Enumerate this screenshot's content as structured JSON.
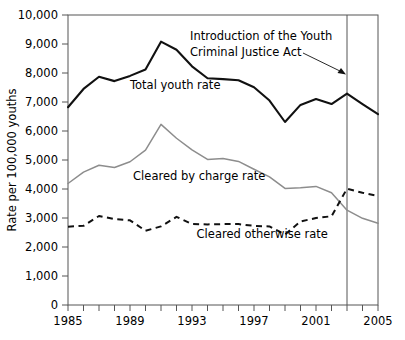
{
  "chart_data": {
    "type": "line",
    "title": "",
    "xlabel": "",
    "ylabel": "Rate per 100,000 youths",
    "xlim": [
      1985,
      2005
    ],
    "ylim": [
      0,
      10000
    ],
    "grid": false,
    "legend_position": "inline-labels",
    "x": [
      1985,
      1986,
      1987,
      1988,
      1989,
      1990,
      1991,
      1992,
      1993,
      1994,
      1995,
      1996,
      1997,
      1998,
      1999,
      2000,
      2001,
      2002,
      2003,
      2004,
      2005
    ],
    "y_ticks": [
      0,
      1000,
      2000,
      3000,
      4000,
      5000,
      6000,
      7000,
      8000,
      9000,
      10000
    ],
    "y_tick_labels": [
      "0",
      "1,000",
      "2,000",
      "3,000",
      "4,000",
      "5,000",
      "6,000",
      "7,000",
      "8,000",
      "9,000",
      "10,000"
    ],
    "x_ticks": [
      1985,
      1986,
      1987,
      1988,
      1989,
      1990,
      1991,
      1992,
      1993,
      1994,
      1995,
      1996,
      1997,
      1998,
      1999,
      2000,
      2001,
      2002,
      2003,
      2004,
      2005
    ],
    "x_tick_labels_shown": [
      "1985",
      "1989",
      "1993",
      "1997",
      "2001",
      "2005"
    ],
    "x_tick_label_values": [
      1985,
      1989,
      1993,
      1997,
      2001,
      2005
    ],
    "series": [
      {
        "name": "Total youth rate",
        "style": "solid-black",
        "color": "#111111",
        "label_x": 1989.0,
        "label_y": 7450,
        "values": [
          6820,
          7450,
          7870,
          7720,
          7900,
          8120,
          9080,
          8800,
          8230,
          7820,
          7790,
          7750,
          7510,
          7050,
          6310,
          6900,
          7100,
          6930,
          7290,
          6930,
          6580
        ]
      },
      {
        "name": "Cleared by charge rate",
        "style": "solid-gray",
        "color": "#8d8d8d",
        "label_x": 1989.2,
        "label_y": 4300,
        "values": [
          4190,
          4580,
          4820,
          4740,
          4940,
          5340,
          6230,
          5750,
          5350,
          5020,
          5050,
          4950,
          4680,
          4420,
          4020,
          4040,
          4090,
          3870,
          3270,
          2990,
          2820
        ]
      },
      {
        "name": "Cleared otherwise rate",
        "style": "dashed-black",
        "color": "#111111",
        "label_x": 1993.3,
        "label_y": 2300,
        "values": [
          2700,
          2730,
          3070,
          2960,
          2920,
          2560,
          2710,
          3040,
          2790,
          2780,
          2790,
          2790,
          2730,
          2710,
          2430,
          2880,
          3000,
          3060,
          4010,
          3870,
          3760
        ]
      }
    ],
    "annotations": [
      {
        "name": "ycja-annotation",
        "text_line1": "Introduction of the Youth",
        "text_line2": "Criminal Justice Act",
        "points_to_year": 2003,
        "vertical_line_year": 2003
      }
    ]
  }
}
